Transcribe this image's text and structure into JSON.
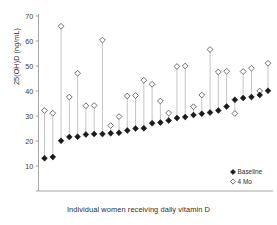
{
  "chart_data": {
    "type": "scatter",
    "title": "",
    "xlabel": "Individual women receiving daily vitamin D",
    "ylabel": "25(OH)D (ng/mL)",
    "ylim": [
      0,
      70
    ],
    "yticks": [
      0,
      10,
      20,
      30,
      40,
      50,
      60,
      70
    ],
    "ytick_labels": [
      "",
      "10",
      "20",
      "30",
      "40",
      "50",
      "60",
      "70"
    ],
    "grid": false,
    "legend_position": "bottom-right",
    "x": [
      1,
      2,
      3,
      4,
      5,
      6,
      7,
      8,
      9,
      10,
      11,
      12,
      13,
      14,
      15,
      16,
      17,
      18,
      19,
      20,
      21,
      22,
      23,
      24,
      25,
      26,
      27,
      28
    ],
    "series": [
      {
        "name": "Baseline",
        "marker": "filled-diamond",
        "color": "#1a1a1a",
        "values": [
          13.1,
          13.6,
          20.1,
          21.6,
          21.7,
          22.6,
          22.8,
          22.8,
          23.1,
          23.3,
          24.2,
          25.0,
          25.1,
          27.1,
          27.4,
          28.2,
          29.2,
          29.6,
          30.4,
          30.9,
          31.4,
          32.2,
          33.8,
          36.5,
          37.2,
          37.6,
          38.4,
          40.1
        ]
      },
      {
        "name": "4 Mo",
        "marker": "open-diamond",
        "color": "#1a1a1a",
        "values": [
          32.2,
          31.1,
          65.9,
          37.6,
          47.1,
          34.1,
          34.2,
          60.4,
          26.2,
          29.8,
          38.0,
          38.2,
          44.3,
          42.7,
          36.0,
          31.2,
          49.8,
          50.0,
          33.7,
          38.4,
          56.6,
          47.6,
          47.9,
          31.0,
          47.8,
          49.1,
          40.0,
          51.1
        ]
      }
    ],
    "legend": [
      {
        "label": "Baseline",
        "marker": "filled-diamond"
      },
      {
        "label": "4 Mo",
        "marker": "open-diamond"
      }
    ]
  },
  "axis": {
    "y_title": "25(OH)D (ng/mL)",
    "x_title": "Individual women receiving daily vitamin D"
  }
}
